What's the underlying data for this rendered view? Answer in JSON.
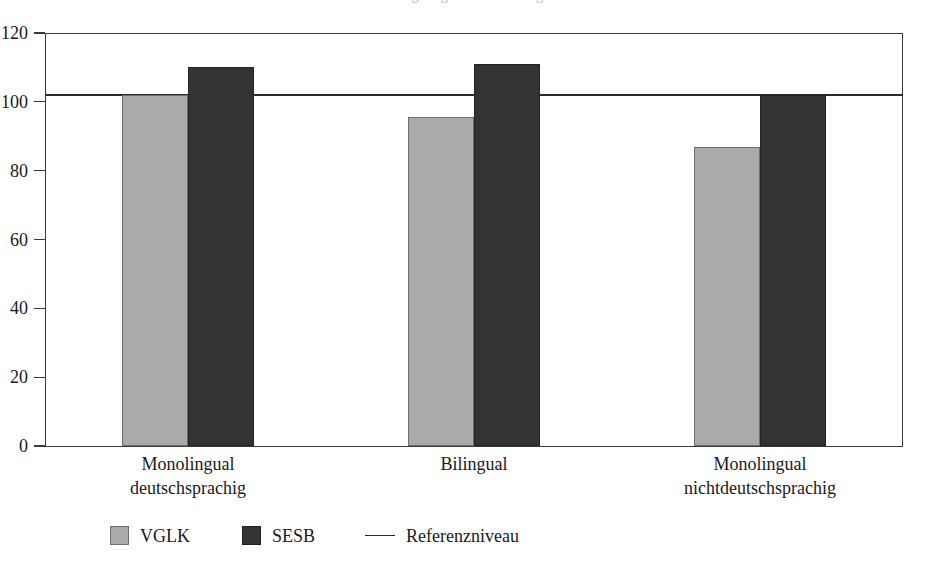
{
  "figure": {
    "title_clipped": "Abbildung: Ergebnisse im Vergleich",
    "background_color": "#ffffff"
  },
  "colors": {
    "vglk": "#aaaaaa",
    "sesb": "#333333",
    "reference_line": "#2b2b2b",
    "axis": "#3a3a3a",
    "text": "#1a1a1a"
  },
  "chart_data": {
    "type": "bar",
    "title": "",
    "xlabel": "",
    "ylabel": "",
    "ylim": [
      0,
      120
    ],
    "yticks": [
      0,
      20,
      40,
      60,
      80,
      100,
      120
    ],
    "ytick_labels": [
      "0",
      "20",
      "40",
      "60",
      "80",
      "100",
      "120"
    ],
    "grid": false,
    "legend_position": "bottom-left",
    "categories": [
      "Monolingual deutschsprachig",
      "Bilingual",
      "Monolingual nichtdeutschsprachig"
    ],
    "category_lines": [
      [
        "Monolingual",
        "deutschsprachig"
      ],
      [
        "Bilingual",
        ""
      ],
      [
        "Monolingual",
        "nichtdeutschsprachig"
      ]
    ],
    "series": [
      {
        "name": "VGLK",
        "color": "#aaaaaa",
        "values": [
          102,
          95.5,
          87
        ]
      },
      {
        "name": "SESB",
        "color": "#333333",
        "values": [
          110,
          111,
          102
        ]
      }
    ],
    "reference": {
      "name": "Referenzniveau",
      "value": 102,
      "color": "#2b2b2b"
    }
  },
  "legend": {
    "items": [
      {
        "label": "VGLK",
        "marker": "swatch-light-gray"
      },
      {
        "label": "SESB",
        "marker": "swatch-dark"
      },
      {
        "label": "Referenzniveau",
        "marker": "line"
      }
    ]
  }
}
